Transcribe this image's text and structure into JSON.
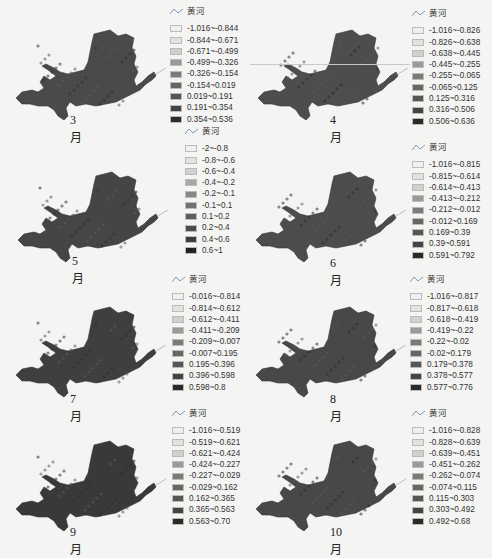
{
  "legend_title": "黄河",
  "swatch_colors": [
    "#f0f0f0",
    "#e2e2e2",
    "#cfcfcf",
    "#9a9a9a",
    "#7a7a7a",
    "#666666",
    "#555555",
    "#444444",
    "#2a2a2a"
  ],
  "swatch_colors_10": [
    "#f0f0f0",
    "#e2e2e2",
    "#d0d0d0",
    "#a8a8a8",
    "#888888",
    "#707070",
    "#5e5e5e",
    "#4c4c4c",
    "#3c3c3c",
    "#222222"
  ],
  "chart_data": [
    {
      "type": "heatmap",
      "title": "3月",
      "legend_title": "黄河",
      "legend_classes": [
        "-1.016~-0.844",
        "-0.844~-0.671",
        "-0.671~-0.499",
        "-0.499~-0.326",
        "-0.326~-0.154",
        "-0.154~0.019",
        "0.019~0.191",
        "0.191~0.354",
        "0.354~0.536"
      ]
    },
    {
      "type": "heatmap",
      "title": "4月",
      "legend_title": "黄河",
      "legend_classes": [
        "-1.016~-0.826",
        "-0.826~-0.638",
        "-0.638~-0.445",
        "-0.445~-0.255",
        "-0.255~-0.065",
        "-0.065~0.125",
        "0.125~0.316",
        "0.316~0.506",
        "0.506~0.636"
      ]
    },
    {
      "type": "heatmap",
      "title": "5月",
      "legend_title": "黄河",
      "legend_classes": [
        "-2~-0.8",
        "-0.8~-0.6",
        "-0.6~-0.4",
        "-0.4~-0.2",
        "-0.2~-0.1",
        "-0.1~0.1",
        "0.1~0.2",
        "0.2~0.4",
        "0.4~0.6",
        "0.6~1"
      ]
    },
    {
      "type": "heatmap",
      "title": "6月",
      "legend_title": "黄河",
      "legend_classes": [
        "-1.016~-0.815",
        "-0.815~-0.614",
        "-0.614~-0.413",
        "-0.413~-0.212",
        "-0.212~-0.012",
        "-0.012~0.169",
        "0.169~0.39",
        "0.39~0.591",
        "0.591~0.792"
      ]
    },
    {
      "type": "heatmap",
      "title": "7月",
      "legend_title": "黄河",
      "legend_classes": [
        "-0.016~-0.814",
        "-0.814~-0.612",
        "-0.612~-0.411",
        "-0.411~-0.209",
        "-0.209~-0.007",
        "-0.007~0.195",
        "0.195~0.396",
        "0.396~0.598",
        "0.598~0.8"
      ]
    },
    {
      "type": "heatmap",
      "title": "8月",
      "legend_title": "黄河",
      "legend_classes": [
        "-1.016~-0.817",
        "-0.817~-0.618",
        "-0.618~-0.419",
        "-0.419~-0.22",
        "-0.22~-0.02",
        "-0.02~0.179",
        "0.179~0.378",
        "0.378~0.577",
        "0.577~0.776"
      ]
    },
    {
      "type": "heatmap",
      "title": "9月",
      "legend_title": "黄河",
      "legend_classes": [
        "-1.016~-0.519",
        "-0.519~-0.621",
        "-0.621~-0.424",
        "-0.424~-0.227",
        "-0.227~-0.029",
        "-0.029~0.162",
        "0.162~0.365",
        "0.365~0.563",
        "0.563~0.70"
      ]
    },
    {
      "type": "heatmap",
      "title": "10月",
      "legend_title": "黄河",
      "legend_classes": [
        "-1.016~-0.828",
        "-0.828~-0.639",
        "-0.639~-0.451",
        "-0.451~-0.262",
        "-0.262~-0.074",
        "-0.074~0.115",
        "0.115~0.303",
        "0.303~0.492",
        "0.492~0.68"
      ]
    }
  ],
  "panels": [
    {
      "caption": "3月",
      "legend": [
        "-1.016~-0.844",
        "-0.844~-0.671",
        "-0.671~-0.499",
        "-0.499~-0.326",
        "-0.326~-0.154",
        "-0.154~0.019",
        "0.019~0.191",
        "0.191~0.354",
        "0.354~0.536"
      ]
    },
    {
      "caption": "4月",
      "legend": [
        "-1.016~-0.826",
        "-0.826~-0.638",
        "-0.638~-0.445",
        "-0.445~-0.255",
        "-0.255~-0.065",
        "-0.065~0.125",
        "0.125~0.316",
        "0.316~0.506",
        "0.506~0.636"
      ]
    },
    {
      "caption": "5月",
      "legend": [
        "-2~-0.8",
        "-0.8~-0.6",
        "-0.6~-0.4",
        "-0.4~-0.2",
        "-0.2~-0.1",
        "-0.1~0.1",
        "0.1~0.2",
        "0.2~0.4",
        "0.4~0.6",
        "0.6~1"
      ]
    },
    {
      "caption": "6月",
      "legend": [
        "-1.016~-0.815",
        "-0.815~-0.614",
        "-0.614~-0.413",
        "-0.413~-0.212",
        "-0.212~-0.012",
        "-0.012~0.169",
        "0.169~0.39",
        "0.39~0.591",
        "0.591~0.792"
      ]
    },
    {
      "caption": "7月",
      "legend": [
        "-0.016~-0.814",
        "-0.814~-0.612",
        "-0.612~-0.411",
        "-0.411~-0.209",
        "-0.209~-0.007",
        "-0.007~0.195",
        "0.195~0.396",
        "0.396~0.598",
        "0.598~0.8"
      ]
    },
    {
      "caption": "8月",
      "legend": [
        "-1.016~-0.817",
        "-0.817~-0.618",
        "-0.618~-0.419",
        "-0.419~-0.22",
        "-0.22~-0.02",
        "-0.02~0.179",
        "0.179~0.378",
        "0.378~0.577",
        "0.577~0.776"
      ]
    },
    {
      "caption": "9月",
      "legend": [
        "-1.016~-0.519",
        "-0.519~-0.621",
        "-0.621~-0.424",
        "-0.424~-0.227",
        "-0.227~-0.029",
        "-0.029~0.162",
        "0.162~0.365",
        "0.365~0.563",
        "0.563~0.70"
      ]
    },
    {
      "caption": "10月",
      "legend": [
        "-1.016~-0.828",
        "-0.828~-0.639",
        "-0.639~-0.451",
        "-0.451~-0.262",
        "-0.262~-0.074",
        "-0.074~0.115",
        "0.115~0.303",
        "0.303~0.492",
        "0.492~0.68"
      ]
    }
  ]
}
